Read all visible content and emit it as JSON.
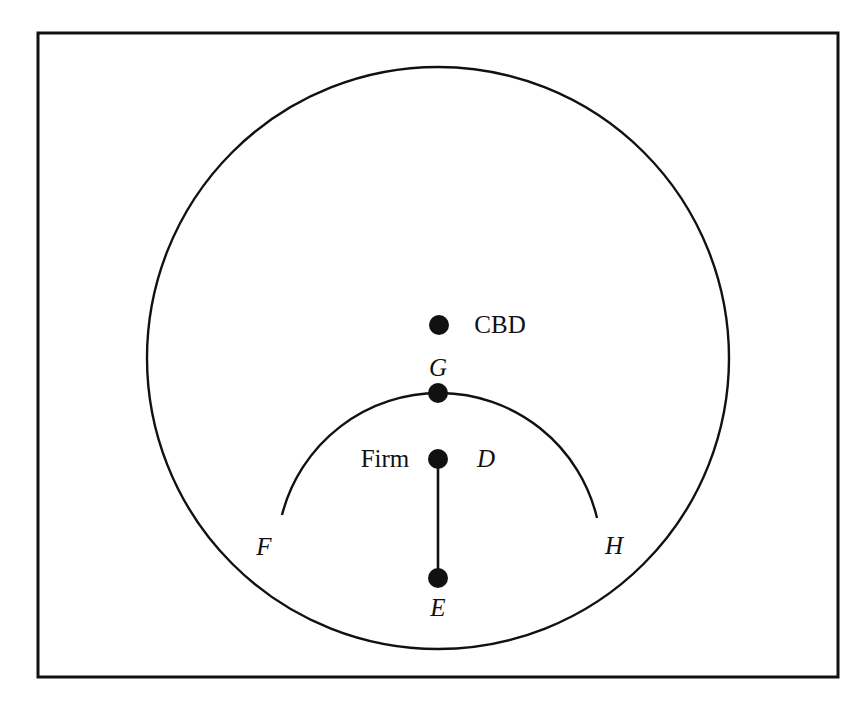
{
  "figure": {
    "background_color": "#ffffff",
    "stroke_color": "#111111",
    "frame": {
      "x": 38,
      "y": 33,
      "width": 800,
      "height": 644,
      "stroke_width": 3
    }
  },
  "chart_data": {
    "type": "diagram",
    "title": "",
    "shapes": [
      {
        "name": "city-boundary-circle",
        "kind": "circle",
        "cx": 438,
        "cy": 358,
        "r": 291,
        "stroke": "#111111",
        "stroke_width": 2.4,
        "fill": "none"
      },
      {
        "name": "firm-market-area-upper-arc",
        "kind": "arc",
        "start": [
          282,
          515
        ],
        "through": [
          438,
          393
        ],
        "end": [
          597,
          518
        ],
        "stroke": "#111111",
        "stroke_width": 2.4,
        "fill": "none"
      }
    ],
    "segments": [
      {
        "name": "firm-to-edge-segment",
        "from": "D",
        "to": "E",
        "x1": 438,
        "y1": 459,
        "x2": 438,
        "y2": 578,
        "stroke": "#111111",
        "stroke_width": 2.6
      }
    ],
    "points": [
      {
        "id": "CBD",
        "label": "CBD",
        "label_style": "upright",
        "x": 439,
        "y": 325,
        "r": 10,
        "label_x": 500,
        "label_y": 324
      },
      {
        "id": "G",
        "label": "G",
        "label_style": "italic",
        "x": 438,
        "y": 393,
        "r": 10,
        "label_x": 438,
        "label_y": 367
      },
      {
        "id": "D",
        "label": "D",
        "label_style": "italic",
        "x": 438,
        "y": 459,
        "r": 10,
        "label_x": 486,
        "label_y": 458
      },
      {
        "id": "E",
        "label": "E",
        "label_style": "italic",
        "x": 438,
        "y": 578,
        "r": 10,
        "label_x": 438,
        "label_y": 607
      },
      {
        "id": "F",
        "label": "F",
        "label_style": "italic",
        "x": 282,
        "y": 515,
        "r": 0,
        "label_x": 264,
        "label_y": 546
      },
      {
        "id": "H",
        "label": "H",
        "label_style": "italic",
        "x": 597,
        "y": 518,
        "r": 0,
        "label_x": 614,
        "label_y": 545
      }
    ],
    "text_labels": [
      {
        "id": "firm",
        "text": "Firm",
        "style": "upright",
        "x": 385,
        "y": 458,
        "font_size": 25
      },
      {
        "id": "cbd",
        "text": "CBD",
        "style": "upright",
        "x": 500,
        "y": 324,
        "font_size": 25
      },
      {
        "id": "g",
        "text": "G",
        "style": "italic",
        "x": 438,
        "y": 367,
        "font_size": 25
      },
      {
        "id": "d",
        "text": "D",
        "style": "italic",
        "x": 486,
        "y": 458,
        "font_size": 25
      },
      {
        "id": "e",
        "text": "E",
        "style": "italic",
        "x": 438,
        "y": 607,
        "font_size": 25
      },
      {
        "id": "f",
        "text": "F",
        "style": "italic",
        "x": 264,
        "y": 546,
        "font_size": 25
      },
      {
        "id": "h",
        "text": "H",
        "style": "italic",
        "x": 614,
        "y": 545,
        "font_size": 25
      }
    ]
  }
}
